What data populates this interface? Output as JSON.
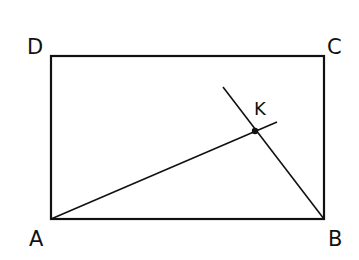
{
  "figure": {
    "type": "geometry-diagram",
    "points": {
      "A": {
        "label": "A",
        "x": 51,
        "y": 219
      },
      "B": {
        "label": "B",
        "x": 324,
        "y": 219
      },
      "C": {
        "label": "C",
        "x": 324,
        "y": 56
      },
      "D": {
        "label": "D",
        "x": 51,
        "y": 56
      },
      "K": {
        "label": "K",
        "x": 255,
        "y": 131
      }
    },
    "segments": [
      {
        "from": "A",
        "to": "B"
      },
      {
        "from": "B",
        "to": "C"
      },
      {
        "from": "C",
        "to": "D"
      },
      {
        "from": "D",
        "to": "A"
      },
      {
        "from": "A",
        "to": "K",
        "extends_to": {
          "x": 277,
          "y": 122
        }
      },
      {
        "from": "B",
        "to": "K",
        "extends_to": {
          "x": 223,
          "y": 87
        }
      }
    ],
    "stroke_color": "#111111"
  }
}
